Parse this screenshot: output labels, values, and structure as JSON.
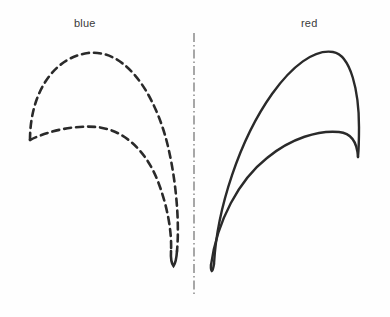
{
  "figure": {
    "title_blue": "blue",
    "title_red": "red",
    "background_color": "#fefefe",
    "stroke_color": "#2a2a2a",
    "centerline_color": "#555555",
    "labels": [
      {
        "text": "blue",
        "x": 74,
        "y": 18,
        "name": "label-blue"
      },
      {
        "text": "red",
        "x": 301,
        "y": 18,
        "name": "label-red"
      }
    ],
    "centerline": {
      "name": "symmetry-centerline",
      "x": 194,
      "y_top": 33,
      "y_bottom": 296,
      "style": "dash-dot",
      "dash_pattern": "9 3 1.5 3",
      "stroke_width": 1.2,
      "color": "#555555"
    },
    "profiles": [
      {
        "name": "blue-profile",
        "label": "blue",
        "line_style": "dashed",
        "dash_pattern": "7 5",
        "stroke_width": 2.6,
        "color": "#2a2a2a",
        "side": "left",
        "upper_surface_path": "M 30 140 C 30 95, 52 58, 88 53 C 122 49, 150 85, 165 135 C 175 170, 180 215, 178 252",
        "lower_surface_path": "M 30 140 C 48 131, 75 126, 98 128 C 125 131, 145 150, 158 180 C 168 205, 173 232, 172 252",
        "tip_path": "M 178 252 C 177 259, 175 264, 173 266 C 171 264, 170 259, 172 252",
        "leading_edge_path": "M 30 140 L 30 140"
      },
      {
        "name": "red-profile",
        "label": "red",
        "line_style": "solid",
        "dash_pattern": "none",
        "stroke_width": 2.4,
        "color": "#2a2a2a",
        "side": "right",
        "upper_surface_path": "M 215 265 C 218 210, 240 140, 272 94 C 292 66, 315 50, 334 53 C 352 56, 360 92, 360 128 C 360 145, 359 152, 358 157",
        "lower_surface_path": "M 212 266 C 218 222, 240 180, 268 157 C 292 137, 320 130, 340 132 C 352 133, 357 141, 358 157",
        "trailing_edge_path": "M 358 157 L 358 157",
        "nose_path": "M 215 265 C 214 269, 213 271, 212 271 C 211 270, 211 268, 212 266"
      }
    ]
  },
  "meta": {
    "width": 390,
    "height": 317,
    "diagram_type": "blade-profile-comparison"
  }
}
